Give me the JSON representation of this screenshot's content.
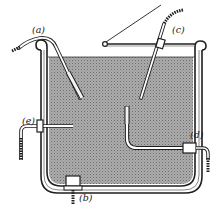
{
  "figure": {
    "colors": {
      "ink": "#1f1f1f",
      "liquid_fill": "#a9a9a9",
      "liquid_dots": "#7c7c7c",
      "background": "#ffffff"
    },
    "labels": {
      "a": "(a)",
      "b": "(b)",
      "c": "(c)",
      "d": "(d)",
      "e": "(e)"
    },
    "parts": [
      {
        "id": "a",
        "name": "probe hooked over tank rim, immersed diagonally"
      },
      {
        "id": "b",
        "name": "probe through bottom fitting"
      },
      {
        "id": "c",
        "name": "probe through lid gland, diagonal"
      },
      {
        "id": "d",
        "name": "L-shaped probe through side wall fitting"
      },
      {
        "id": "e",
        "name": "horizontal probe through side wall"
      }
    ]
  }
}
